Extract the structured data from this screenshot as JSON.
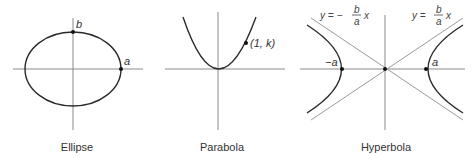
{
  "figures": [
    {
      "name": "ellipse",
      "caption": "Ellipse",
      "labels": {
        "vertex_b": "b",
        "vertex_a": "a"
      }
    },
    {
      "name": "parabola",
      "caption": "Parabola",
      "labels": {
        "point": "(1, k)"
      }
    },
    {
      "name": "hyperbola",
      "caption": "Hyperbola",
      "labels": {
        "vertex_neg_a": "−a",
        "vertex_a": "a",
        "asymptote_neg": {
          "lhs": "y = −",
          "num": "b",
          "den": "a",
          "var": "x"
        },
        "asymptote_pos": {
          "lhs": "y =",
          "num": "b",
          "den": "a",
          "var": "x"
        }
      }
    }
  ],
  "colors": {
    "curve": "#2a2a2a",
    "axis": "#8a8a8a",
    "text": "#333333"
  }
}
